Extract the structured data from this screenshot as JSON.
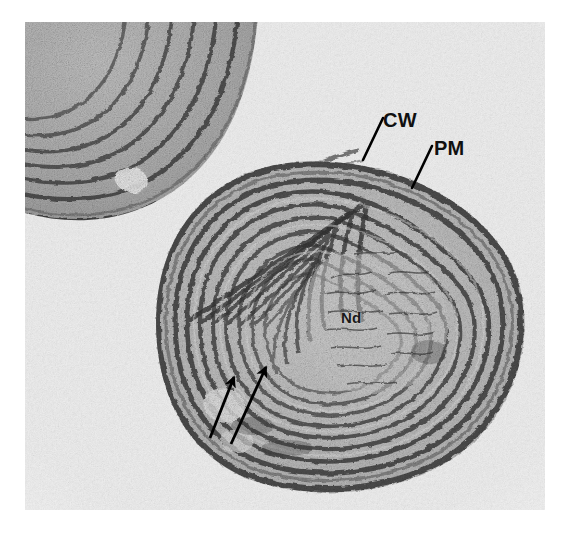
{
  "figure": {
    "kind": "transmission-electron-micrograph",
    "background_color": "#ffffff",
    "plate_color": "#e9e9e9"
  },
  "annotations": {
    "cell_wall": {
      "label": "CW",
      "meaning": "cell wall",
      "label_x": 383,
      "label_y": 110,
      "leader_from_x": 383,
      "leader_from_y": 118,
      "leader_to_x": 363,
      "leader_to_y": 160
    },
    "plasma_membrane": {
      "label": "PM",
      "meaning": "plasma membrane",
      "label_x": 434,
      "label_y": 138,
      "leader_from_x": 432,
      "leader_from_y": 146,
      "leader_to_x": 412,
      "leader_to_y": 188
    },
    "nucleoid": {
      "label": "Nd",
      "meaning": "nucleoid",
      "label_x": 341,
      "label_y": 310
    },
    "arrows": [
      {
        "name": "thylakoid-arrow-left",
        "tail_x": 210,
        "tail_y": 438,
        "tip_x": 234,
        "tip_y": 377,
        "color": "#000000"
      },
      {
        "name": "thylakoid-arrow-right",
        "tail_x": 231,
        "tail_y": 444,
        "tip_x": 266,
        "tip_y": 367,
        "color": "#000000"
      }
    ]
  },
  "specimen": {
    "main_cell": {
      "name": "main-cell",
      "center_x": 316,
      "center_y": 303,
      "radius_x": 185,
      "radius_y": 163,
      "thylakoid_layers": 7,
      "has_central_invagination": true
    },
    "partial_cell": {
      "name": "partial-cell-top-left",
      "center_x": 95,
      "center_y": 60,
      "radius_x": 135,
      "radius_y": 120,
      "thylakoid_layers": 6
    }
  },
  "palette": {
    "ink_dark": "#2a2a2a",
    "ink_mid": "#5f5f5f",
    "ink_light": "#8d8d8d",
    "cytoplasm": "#b9b9b9",
    "lumen": "#dcdcdc",
    "label_color": "#101010"
  }
}
